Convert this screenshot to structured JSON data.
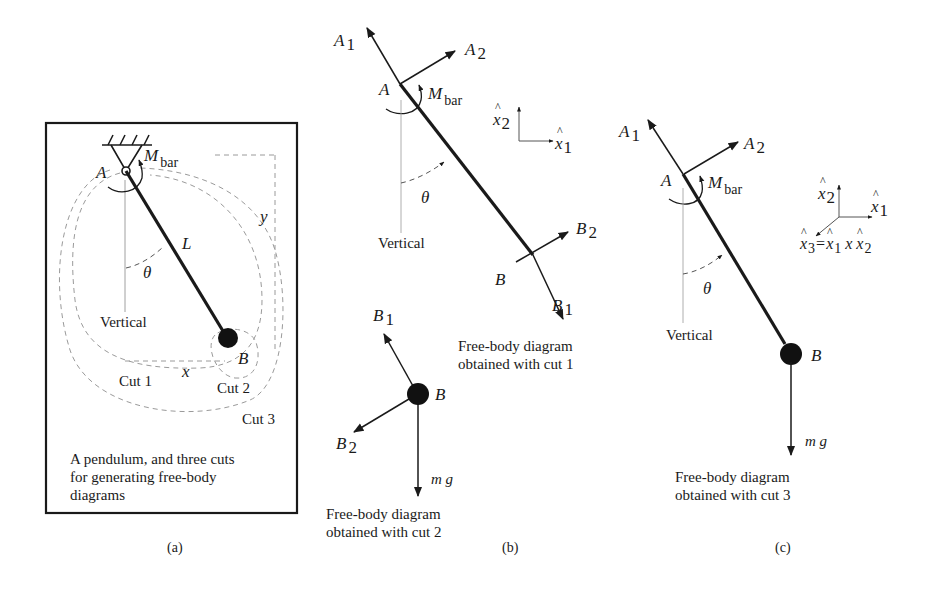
{
  "colors": {
    "ink": "#1a1a1a",
    "dashed": "#9a9a9a",
    "background": "#ffffff"
  },
  "panel_a": {
    "label": "(a)",
    "caption_lines": [
      "A pendulum, and three cuts",
      "for generating free-body",
      "diagrams"
    ],
    "point_A": "A",
    "point_B": "B",
    "moment": {
      "main": "M",
      "sub": "bar"
    },
    "length": "L",
    "angle": "θ",
    "vertical": "Vertical",
    "x": "x",
    "y": "y",
    "cuts": [
      "Cut 1",
      "Cut 2",
      "Cut 3"
    ]
  },
  "panel_b": {
    "label": "(b)",
    "fbd1": {
      "caption_lines": [
        "Free-body diagram",
        "obtained with cut 1"
      ],
      "A1": {
        "main": "A",
        "sub": "1"
      },
      "A2": {
        "main": "A",
        "sub": "2"
      },
      "point_A": "A",
      "moment": {
        "main": "M",
        "sub": "bar"
      },
      "angle": "θ",
      "vertical": "Vertical",
      "point_B": "B",
      "B1": {
        "main": "B",
        "sub": "1"
      },
      "B2": {
        "main": "B",
        "sub": "2"
      },
      "axes": {
        "x1": {
          "main": "x",
          "sub": "1",
          "hat": "^"
        },
        "x2": {
          "main": "x",
          "sub": "2",
          "hat": "^"
        }
      }
    },
    "fbd2": {
      "caption_lines": [
        "Free-body diagram",
        "obtained with cut 2"
      ],
      "point_B": "B",
      "B1": {
        "main": "B",
        "sub": "1"
      },
      "B2": {
        "main": "B",
        "sub": "2"
      },
      "weight": "m g"
    }
  },
  "panel_c": {
    "label": "(c)",
    "caption_lines": [
      "Free-body diagram",
      "obtained with cut 3"
    ],
    "A1": {
      "main": "A",
      "sub": "1"
    },
    "A2": {
      "main": "A",
      "sub": "2"
    },
    "point_A": "A",
    "moment": {
      "main": "M",
      "sub": "bar"
    },
    "angle": "θ",
    "vertical": "Vertical",
    "point_B": "B",
    "weight": "m g",
    "axes": {
      "x1": {
        "main": "x",
        "sub": "1",
        "hat": "^"
      },
      "x2": {
        "main": "x",
        "sub": "2",
        "hat": "^"
      },
      "x3_eq": {
        "lhs_main": "x",
        "lhs_sub": "3",
        "eq": "=",
        "a_main": "x",
        "a_sub": "1",
        "op": "x",
        "b_main": "x",
        "b_sub": "2",
        "hat": "^"
      }
    }
  }
}
